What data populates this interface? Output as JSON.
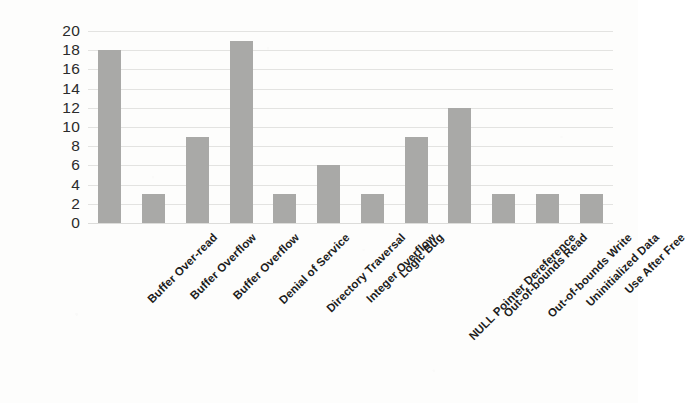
{
  "chart_data": {
    "type": "bar",
    "title": "",
    "subtitle": "",
    "xlabel": "",
    "ylabel": "",
    "ylim": [
      0,
      20
    ],
    "ytick_step": 2,
    "yticks": [
      20,
      18,
      16,
      14,
      12,
      10,
      8,
      6,
      4,
      2,
      0
    ],
    "grid": true,
    "grid_axis": "y",
    "legend": false,
    "legend_position": "none",
    "bar_color": "#a9a9a7",
    "gridline_color": "#e3e3e1",
    "text_color": "#1d1d1d",
    "axis_label_color": "#2b2b2b",
    "background_color": "#fdfdfc",
    "xtick_rotation": -45,
    "categories": [
      "Buffer Over-read",
      "Buffer Overflow",
      "Buffer Overflow",
      "Denial of Service",
      "Directory Traversal",
      "Integer Overflow",
      "Logic Bug",
      "NULL Pointer Dereference",
      "Out-of-bounds Read",
      "Out-of-bounds Write",
      "Uninitialized Data",
      "Use After Free"
    ],
    "values": [
      18,
      3,
      9,
      19,
      3,
      6,
      3,
      9,
      12,
      3,
      3,
      3
    ]
  }
}
